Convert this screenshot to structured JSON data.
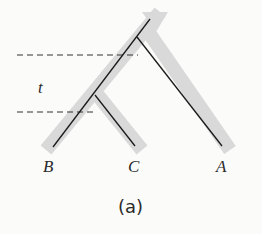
{
  "diagram": {
    "type": "phylogenetic gene tree within species tree",
    "species_tree_color": "#d9d9d9",
    "gene_tree_color": "#1a1a1a",
    "leaves": [
      {
        "id": "B",
        "label": "B"
      },
      {
        "id": "C",
        "label": "C"
      },
      {
        "id": "A",
        "label": "A"
      }
    ],
    "interval_label": "t",
    "caption": "(a)"
  }
}
